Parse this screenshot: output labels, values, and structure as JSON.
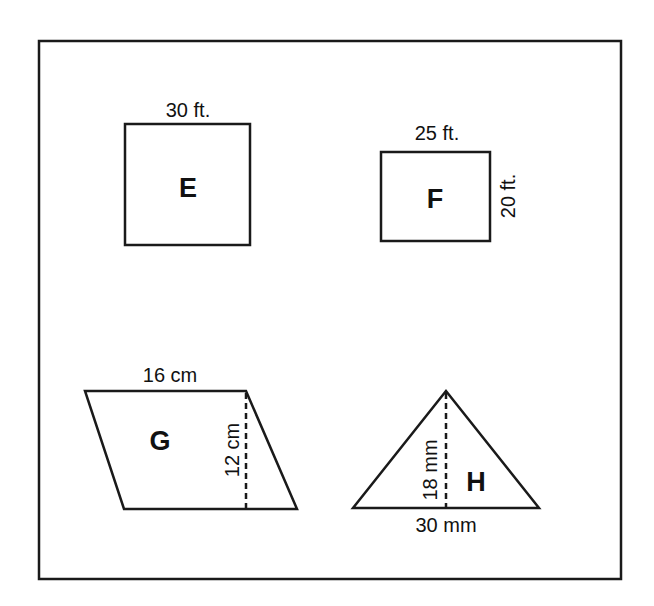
{
  "figures": [
    {
      "id": "E",
      "shape": "square",
      "name": "E",
      "labels": {
        "top": "30 ft."
      }
    },
    {
      "id": "F",
      "shape": "rectangle",
      "name": "F",
      "labels": {
        "top": "25 ft.",
        "right": "20 ft."
      }
    },
    {
      "id": "G",
      "shape": "parallelogram",
      "name": "G",
      "labels": {
        "top": "16 cm",
        "height": "12 cm"
      }
    },
    {
      "id": "H",
      "shape": "triangle",
      "name": "H",
      "labels": {
        "bottom": "30 mm",
        "height": "18 mm"
      }
    }
  ],
  "colors": {
    "stroke": "#1a1a1a",
    "background": "#ffffff"
  }
}
